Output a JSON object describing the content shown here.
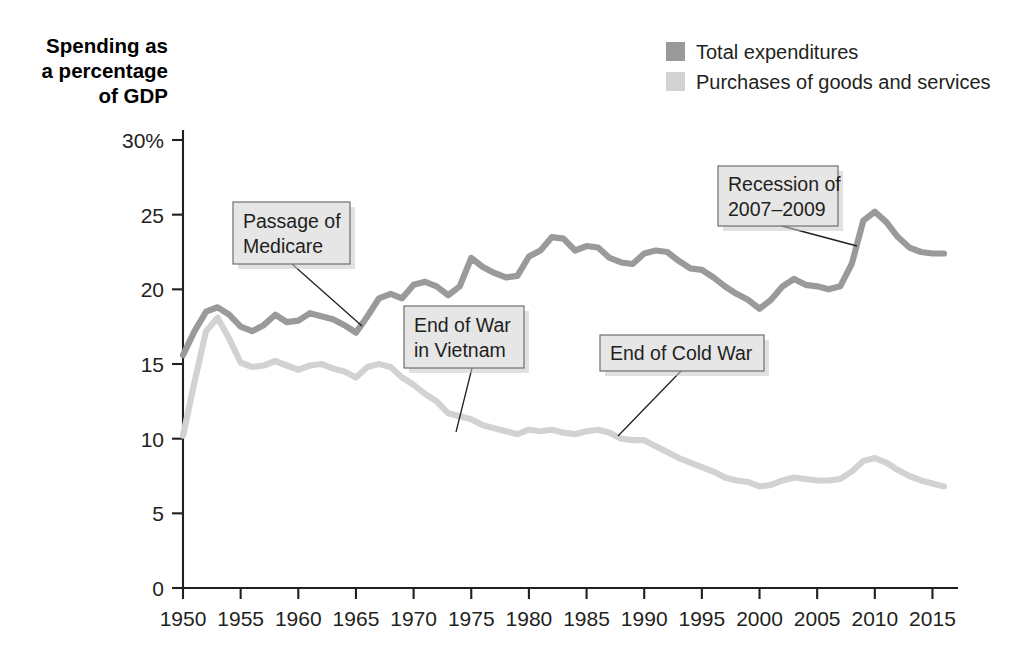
{
  "chart_data": {
    "type": "line",
    "title": "",
    "xlabel": "",
    "ylabel": "Spending as a percentage of GDP",
    "ylabel_lines": [
      "Spending as",
      "a percentage",
      "of GDP"
    ],
    "xlim": [
      1950,
      2016
    ],
    "ylim": [
      0,
      30
    ],
    "grid": false,
    "legend_position": "top-right",
    "xticks": [
      1950,
      1955,
      1960,
      1965,
      1970,
      1975,
      1980,
      1985,
      1990,
      1995,
      2000,
      2005,
      2010,
      2015
    ],
    "xticklabels": [
      "1950",
      "1955",
      "1960",
      "1965",
      "1970",
      "1975",
      "1980",
      "1985",
      "1990",
      "1995",
      "2000",
      "2005",
      "2010",
      "2015"
    ],
    "yticks": [
      0,
      5,
      10,
      15,
      20,
      25,
      30
    ],
    "yticklabels": [
      "0",
      "5",
      "10",
      "15",
      "20",
      "25",
      "30%"
    ],
    "x": [
      1950,
      1951,
      1952,
      1953,
      1954,
      1955,
      1956,
      1957,
      1958,
      1959,
      1960,
      1961,
      1962,
      1963,
      1964,
      1965,
      1966,
      1967,
      1968,
      1969,
      1970,
      1971,
      1972,
      1973,
      1974,
      1975,
      1976,
      1977,
      1978,
      1979,
      1980,
      1981,
      1982,
      1983,
      1984,
      1985,
      1986,
      1987,
      1988,
      1989,
      1990,
      1991,
      1992,
      1993,
      1994,
      1995,
      1996,
      1997,
      1998,
      1999,
      2000,
      2001,
      2002,
      2003,
      2004,
      2005,
      2006,
      2007,
      2008,
      2009,
      2010,
      2011,
      2012,
      2013,
      2014,
      2015,
      2016
    ],
    "series": [
      {
        "name": "Total expenditures",
        "color": "#9a9a9a",
        "values": [
          15.6,
          17.2,
          18.5,
          18.8,
          18.3,
          17.5,
          17.2,
          17.6,
          18.3,
          17.8,
          17.9,
          18.4,
          18.2,
          18.0,
          17.6,
          17.1,
          18.2,
          19.4,
          19.7,
          19.4,
          20.3,
          20.5,
          20.2,
          19.6,
          20.2,
          22.1,
          21.5,
          21.1,
          20.8,
          20.9,
          22.2,
          22.6,
          23.5,
          23.4,
          22.6,
          22.9,
          22.8,
          22.1,
          21.8,
          21.7,
          22.4,
          22.6,
          22.5,
          21.9,
          21.4,
          21.3,
          20.8,
          20.2,
          19.7,
          19.3,
          18.7,
          19.3,
          20.2,
          20.7,
          20.3,
          20.2,
          20.0,
          20.2,
          21.7,
          24.6,
          25.2,
          24.5,
          23.5,
          22.8,
          22.5,
          22.4,
          22.4
        ]
      },
      {
        "name": "Purchases of goods and services",
        "color": "#d2d2d2",
        "values": [
          10.2,
          13.8,
          17.2,
          18.1,
          16.7,
          15.1,
          14.8,
          14.9,
          15.2,
          14.9,
          14.6,
          14.9,
          15.0,
          14.7,
          14.5,
          14.1,
          14.8,
          15.0,
          14.8,
          14.1,
          13.6,
          13.0,
          12.5,
          11.7,
          11.5,
          11.3,
          10.9,
          10.7,
          10.5,
          10.3,
          10.6,
          10.5,
          10.6,
          10.4,
          10.3,
          10.5,
          10.6,
          10.4,
          10.0,
          9.9,
          9.9,
          9.5,
          9.1,
          8.7,
          8.4,
          8.1,
          7.8,
          7.4,
          7.2,
          7.1,
          6.8,
          6.9,
          7.2,
          7.4,
          7.3,
          7.2,
          7.2,
          7.3,
          7.8,
          8.5,
          8.7,
          8.4,
          7.9,
          7.5,
          7.2,
          7.0,
          6.8
        ]
      }
    ],
    "annotations": [
      {
        "id": "passage-of-medicare",
        "lines": [
          "Passage of",
          "Medicare"
        ],
        "box": {
          "x": 233,
          "y": 202,
          "w": 117,
          "h": 62
        },
        "leader": {
          "x1": 292,
          "y1": 264,
          "x2": 362,
          "y2": 326
        }
      },
      {
        "id": "end-of-war-in-vietnam",
        "lines": [
          "End of War",
          "in Vietnam"
        ],
        "box": {
          "x": 404,
          "y": 306,
          "w": 120,
          "h": 62
        },
        "leader": {
          "x1": 472,
          "y1": 368,
          "x2": 456,
          "y2": 432
        }
      },
      {
        "id": "end-of-cold-war",
        "lines": [
          "End of Cold War"
        ],
        "box": {
          "x": 600,
          "y": 335,
          "w": 164,
          "h": 36
        },
        "leader": {
          "x1": 681,
          "y1": 371,
          "x2": 618,
          "y2": 436
        }
      },
      {
        "id": "recession-of-2007-2009",
        "lines": [
          "Recession of",
          "2007–2009"
        ],
        "box": {
          "x": 718,
          "y": 166,
          "w": 120,
          "h": 60
        },
        "leader": {
          "x1": 782,
          "y1": 226,
          "x2": 857,
          "y2": 246
        }
      }
    ]
  },
  "legend": {
    "items": [
      {
        "label": "Total expenditures",
        "swatch": "#9a9a9a"
      },
      {
        "label": "Purchases of goods and services",
        "swatch": "#d2d2d2"
      }
    ]
  },
  "colors": {
    "axis": "#231f20",
    "callout_fill": "#e6e6e6",
    "callout_border": "#6e6e6e",
    "background": "#ffffff"
  }
}
